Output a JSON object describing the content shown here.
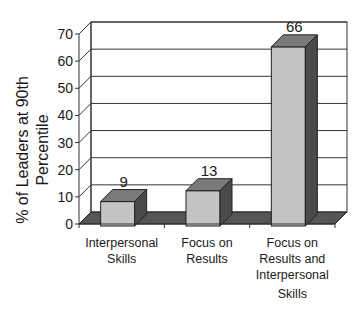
{
  "chart_data": {
    "type": "bar",
    "title": "",
    "xlabel": "",
    "ylabel": "% of Leaders at 90th Percentile",
    "ylabel_lines": [
      "% of Leaders at 90th",
      "Percentile"
    ],
    "ylim": [
      0,
      70
    ],
    "yticks": [
      0,
      10,
      20,
      30,
      40,
      50,
      60,
      70
    ],
    "grid": true,
    "legend": null,
    "style": "3d",
    "categories": [
      "Interpersonal Skills",
      "Focus on Results",
      "Focus on Results and Interpersonal Skills"
    ],
    "category_lines": [
      [
        "Interpersonal",
        "Skills"
      ],
      [
        "Focus on",
        "Results"
      ],
      [
        "Focus on",
        "Results and",
        "Interpersonal",
        "Skills"
      ]
    ],
    "values": [
      9,
      13,
      66
    ],
    "data_labels": [
      "9",
      "13",
      "66"
    ]
  },
  "colors": {
    "bar_front": "#c4c4c4",
    "bar_top": "#7a7a7a",
    "bar_side": "#4a4a4a",
    "floor": "#555555",
    "grid": "#333333"
  }
}
